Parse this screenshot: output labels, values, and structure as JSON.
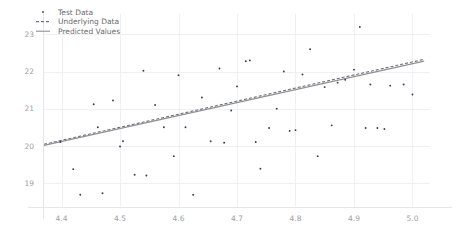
{
  "chart_data": {
    "type": "scatter",
    "title": "",
    "xlabel": "",
    "ylabel": "",
    "xlim": [
      4.37,
      5.03
    ],
    "ylim": [
      18.35,
      23.55
    ],
    "xticks": [
      4.4,
      4.5,
      4.6,
      4.7,
      4.8,
      4.9,
      5.0
    ],
    "xticklabels": [
      "4.4",
      "4.5",
      "4.6",
      "4.7",
      "4.8",
      "4.9",
      "5.0"
    ],
    "yticks": [
      19,
      20,
      21,
      22,
      23
    ],
    "yticklabels": [
      "19",
      "20",
      "21",
      "22",
      "23"
    ],
    "grid": true,
    "legend_position": "upper left",
    "legend": [
      {
        "label": "Test Data",
        "marker": "point",
        "color": "#3b3b4f"
      },
      {
        "label": "Underlying Data",
        "marker": "dashed-line",
        "color": "#6f7076"
      },
      {
        "label": "Predicted Values",
        "marker": "solid-line",
        "color": "#8f9096"
      }
    ],
    "series": [
      {
        "name": "Test Data",
        "type": "scatter",
        "points": [
          [
            4.398,
            20.1
          ],
          [
            4.42,
            19.37
          ],
          [
            4.432,
            18.68
          ],
          [
            4.455,
            21.12
          ],
          [
            4.462,
            20.5
          ],
          [
            4.47,
            18.72
          ],
          [
            4.488,
            21.22
          ],
          [
            4.5,
            19.98
          ],
          [
            4.505,
            20.12
          ],
          [
            4.525,
            19.22
          ],
          [
            4.54,
            22.02
          ],
          [
            4.545,
            19.2
          ],
          [
            4.56,
            21.1
          ],
          [
            4.575,
            20.5
          ],
          [
            4.592,
            19.72
          ],
          [
            4.6,
            21.9
          ],
          [
            4.612,
            20.5
          ],
          [
            4.625,
            18.68
          ],
          [
            4.64,
            21.3
          ],
          [
            4.655,
            20.12
          ],
          [
            4.67,
            22.08
          ],
          [
            4.678,
            20.08
          ],
          [
            4.69,
            20.95
          ],
          [
            4.7,
            21.6
          ],
          [
            4.715,
            22.28
          ],
          [
            4.722,
            22.3
          ],
          [
            4.732,
            20.1
          ],
          [
            4.74,
            19.38
          ],
          [
            4.755,
            20.48
          ],
          [
            4.768,
            21.0
          ],
          [
            4.78,
            22.0
          ],
          [
            4.79,
            20.4
          ],
          [
            4.8,
            20.42
          ],
          [
            4.812,
            21.92
          ],
          [
            4.825,
            22.6
          ],
          [
            4.838,
            19.72
          ],
          [
            4.85,
            21.58
          ],
          [
            4.862,
            20.55
          ],
          [
            4.872,
            21.7
          ],
          [
            4.885,
            21.78
          ],
          [
            4.9,
            22.05
          ],
          [
            4.91,
            23.2
          ],
          [
            4.92,
            20.48
          ],
          [
            4.928,
            21.65
          ],
          [
            4.94,
            20.48
          ],
          [
            4.952,
            20.45
          ],
          [
            4.962,
            21.62
          ],
          [
            4.985,
            21.65
          ],
          [
            5.0,
            21.38
          ]
        ]
      },
      {
        "name": "Underlying Data",
        "type": "line",
        "style": "dashed",
        "points": [
          [
            4.37,
            20.04
          ],
          [
            5.02,
            22.33
          ]
        ]
      },
      {
        "name": "Predicted Values",
        "type": "line",
        "style": "solid",
        "points": [
          [
            4.37,
            20.01
          ],
          [
            5.02,
            22.28
          ]
        ]
      }
    ]
  }
}
